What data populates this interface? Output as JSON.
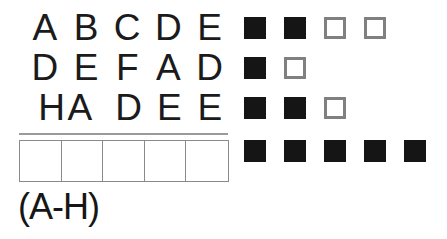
{
  "puzzle": {
    "type": "letter-logic-grid",
    "guess_rows": [
      {
        "row_index": 1,
        "letters": [
          "A",
          "B",
          "C",
          "D",
          "E"
        ],
        "markers": [
          "filled",
          "filled",
          "empty",
          "empty"
        ]
      },
      {
        "row_index": 2,
        "letters": [
          "D",
          "E",
          "F",
          "A",
          "D"
        ],
        "markers": [
          "filled",
          "empty"
        ]
      },
      {
        "row_index": 3,
        "letters": [
          "H",
          "A",
          "D",
          "E",
          "E"
        ],
        "markers": [
          "filled",
          "filled",
          "empty"
        ]
      }
    ],
    "solution_row": {
      "cells": [
        "",
        "",
        "",
        "",
        ""
      ],
      "cell_count": 5,
      "markers": [
        "filled",
        "filled",
        "filled",
        "filled",
        "filled"
      ]
    },
    "range_label": "(A-H)",
    "colors": {
      "letter": "#1b1b1b",
      "marker_filled": "#151515",
      "marker_empty_border": "#808080",
      "grid_border": "#8a8a8a",
      "divider": "#9a9a9a",
      "background": "#ffffff"
    },
    "marker_names": {
      "filled": "filled-square-marker",
      "empty": "empty-square-marker"
    }
  }
}
